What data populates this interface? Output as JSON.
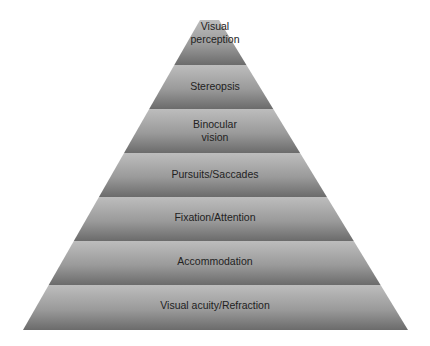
{
  "diagram": {
    "type": "pyramid",
    "layers_top_to_bottom": [
      {
        "label_lines": [
          "Visual",
          "perception"
        ]
      },
      {
        "label_lines": [
          "Stereopsis"
        ]
      },
      {
        "label_lines": [
          "Binocular",
          "vision"
        ]
      },
      {
        "label_lines": [
          "Pursuits/Saccades"
        ]
      },
      {
        "label_lines": [
          "Fixation/Attention"
        ]
      },
      {
        "label_lines": [
          "Accommodation"
        ]
      },
      {
        "label_lines": [
          "Visual acuity/Refraction"
        ]
      }
    ],
    "colors": {
      "band_light": "#bdbdbd",
      "band_dark": "#6b6b6b",
      "text": "#222222"
    }
  }
}
